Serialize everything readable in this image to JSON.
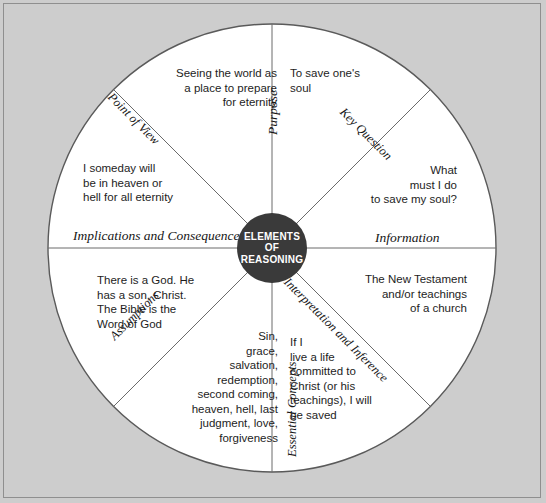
{
  "diagram": {
    "hub": {
      "line1": "ELEMENTS",
      "line2": "OF",
      "line3": "REASONING",
      "fill_color": "#3a3a3a",
      "text_color": "#ffffff"
    },
    "background_color": "#cdcdcd",
    "sector_fill_color": "#ffffff",
    "line_color": "#555555",
    "sectors": [
      {
        "id": "purpose",
        "label": "Purpose",
        "text": "To save one's\nsoul",
        "align": "left"
      },
      {
        "id": "key-question",
        "label": "Key Question",
        "text": "What\nmust I do\nto save my soul?",
        "align": "right"
      },
      {
        "id": "information",
        "label": "Information",
        "text": "The New Testament\nand/or teachings\nof a church",
        "align": "right"
      },
      {
        "id": "interpretation-and-inference",
        "label": "Interpretation and Inference",
        "text": "If I\nlive a life\ncommitted to\nChrist (or his\nteachings), I will\nbe saved",
        "align": "left"
      },
      {
        "id": "essential-concepts",
        "label": "Essential Concepts",
        "text": "Sin,\ngrace,\nsalvation,\nredemption,\nsecond coming,\nheaven, hell, last\njudgment, love,\nforgiveness",
        "align": "right"
      },
      {
        "id": "assumptions",
        "label": "Assumptions",
        "text": "There is a God. He\nhas a son, Christ.\nThe Bible is the\nWord of God",
        "align": "left"
      },
      {
        "id": "implications-and-consequences",
        "label": "Implications and Consequences",
        "text": "I someday will\nbe in heaven or\nhell for all eternity",
        "align": "left"
      },
      {
        "id": "point-of-view",
        "label": "Point of View",
        "text": "Seeing the world as\na place to prepare\nfor eternity",
        "align": "right"
      }
    ]
  }
}
